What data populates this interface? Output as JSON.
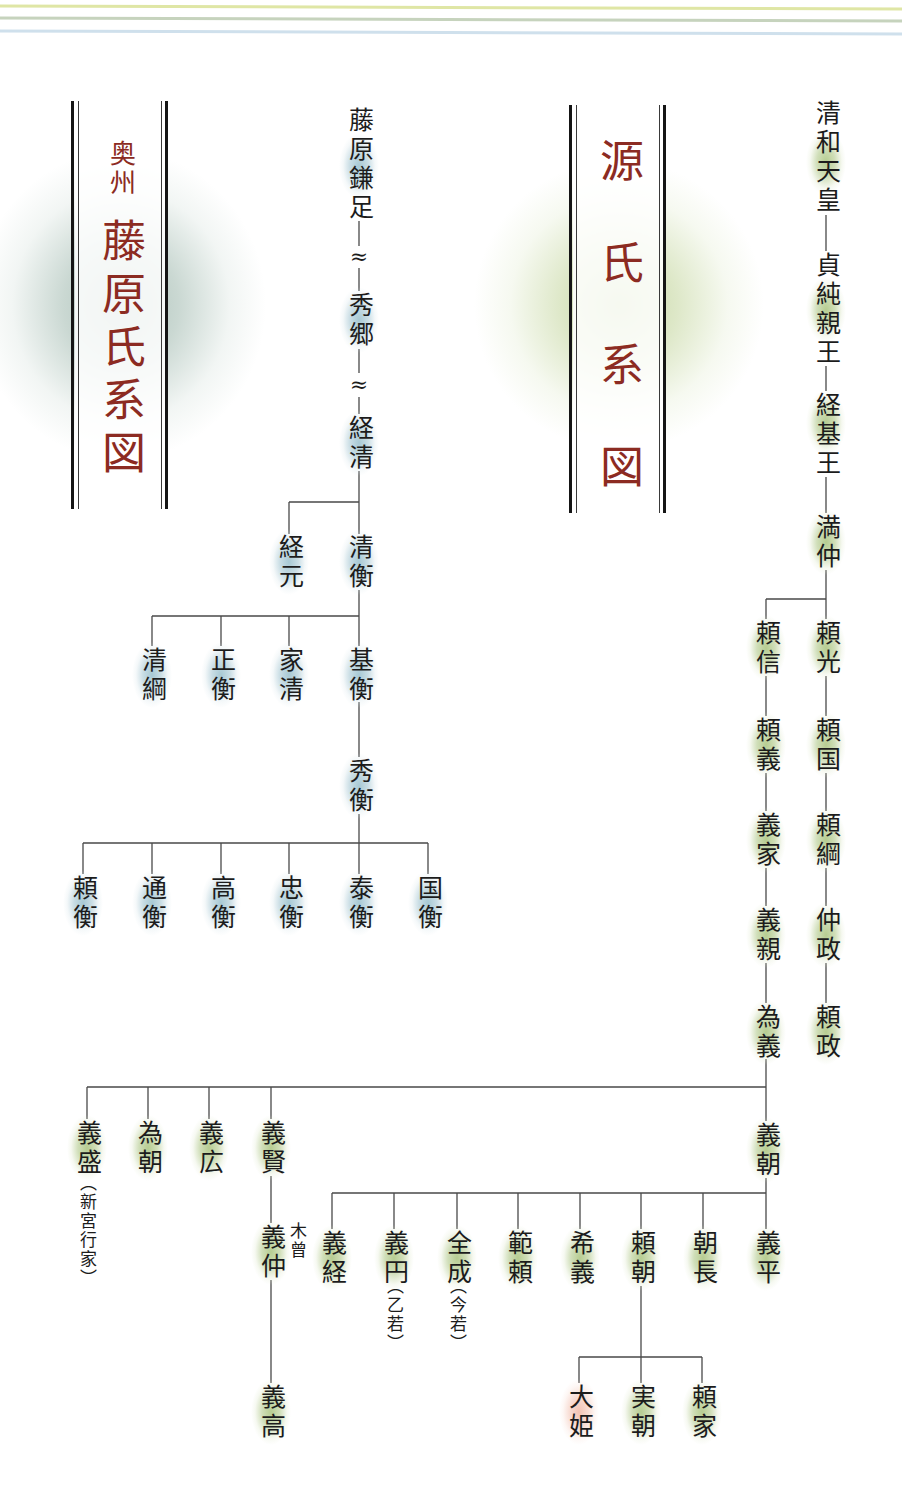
{
  "colors": {
    "title_red": "#8c2b22",
    "text": "#1c1c1c",
    "line": "#4a4a4a",
    "green_highlight": "#b0c888",
    "blue_highlight": "#a0c4d0",
    "pink_highlight": "#f0b8a6",
    "top_line_1": "#dfe6a5",
    "top_line_2": "#c6d3bd",
    "top_line_3": "#cfe0ec"
  },
  "fujiwara": {
    "title_prefix": "奥州",
    "title": "藤原氏系図",
    "gap_mark": "≈",
    "nodes": {
      "kamatari": "藤原鎌足",
      "hidesato": "秀郷",
      "tsunekiyo": "経清",
      "tsunemoto": "経元",
      "kiyohira": "清衡",
      "kiyotsuna": "清綱",
      "masahira": "正衡",
      "iekiyo": "家清",
      "motohira": "基衡",
      "hidehira": "秀衡",
      "yorihira": "頼衡",
      "michihira": "通衡",
      "takahira": "高衡",
      "tadahira": "忠衡",
      "yasuhira": "泰衡",
      "kunihira": "国衡"
    },
    "edges": [
      [
        "kamatari",
        "hidesato"
      ],
      [
        "hidesato",
        "tsunekiyo"
      ],
      [
        "tsunekiyo",
        "tsunemoto"
      ],
      [
        "tsunekiyo",
        "kiyohira"
      ],
      [
        "kiyohira",
        "kiyotsuna"
      ],
      [
        "kiyohira",
        "masahira"
      ],
      [
        "kiyohira",
        "iekiyo"
      ],
      [
        "kiyohira",
        "motohira"
      ],
      [
        "motohira",
        "hidehira"
      ],
      [
        "hidehira",
        "yorihira"
      ],
      [
        "hidehira",
        "michihira"
      ],
      [
        "hidehira",
        "takahira"
      ],
      [
        "hidehira",
        "tadahira"
      ],
      [
        "hidehira",
        "yasuhira"
      ],
      [
        "hidehira",
        "kunihira"
      ]
    ]
  },
  "genji": {
    "title": "源氏系図",
    "nodes": {
      "seiwa_tenno": "清和天皇",
      "sadazumi_shinno": "貞純親王",
      "tsunemoto_o": "経基王",
      "mitsunaka": "満仲",
      "yorimitsu": "頼光",
      "yorinobu": "頼信",
      "yoriyoshi": "頼義",
      "yorikuni": "頼国",
      "yoshiie": "義家",
      "yoritsuna": "頼綱",
      "yoshichika": "義親",
      "nakamasa": "仲政",
      "tameyoshi": "為義",
      "yorimasa": "頼政",
      "yoshimori": "義盛",
      "tametomo": "為朝",
      "yoshihiro": "義広",
      "yoshikata": "義賢",
      "yoshitomo": "義朝",
      "yoshinaka": "義仲",
      "yoshitaka": "義高",
      "yoshitsune": "義経",
      "gien": "義円",
      "zenjo": "全成",
      "noriyori": "範頼",
      "mareyoshi": "希義",
      "yoritomo": "頼朝",
      "tomonaga": "朝長",
      "yoshihira": "義平",
      "ohime": "大姫",
      "sanetomo": "実朝",
      "yoriie": "頼家"
    },
    "notes": {
      "yoshimori": "︵新宮行家︶",
      "yoshinaka": "木曾",
      "gien": "︵乙若︶",
      "zenjo": "︵今若︶"
    },
    "edges": [
      [
        "seiwa_tenno",
        "sadazumi_shinno"
      ],
      [
        "sadazumi_shinno",
        "tsunemoto_o"
      ],
      [
        "tsunemoto_o",
        "mitsunaka"
      ],
      [
        "mitsunaka",
        "yorimitsu"
      ],
      [
        "mitsunaka",
        "yorinobu"
      ],
      [
        "yorimitsu",
        "yorikuni"
      ],
      [
        "yorikuni",
        "yoritsuna"
      ],
      [
        "yoritsuna",
        "nakamasa"
      ],
      [
        "nakamasa",
        "yorimasa"
      ],
      [
        "yorinobu",
        "yoriyoshi"
      ],
      [
        "yoriyoshi",
        "yoshiie"
      ],
      [
        "yoshiie",
        "yoshichika"
      ],
      [
        "yoshichika",
        "tameyoshi"
      ],
      [
        "tameyoshi",
        "yoshitomo"
      ],
      [
        "tameyoshi",
        "yoshikata"
      ],
      [
        "tameyoshi",
        "yoshihiro"
      ],
      [
        "tameyoshi",
        "tametomo"
      ],
      [
        "tameyoshi",
        "yoshimori"
      ],
      [
        "yoshikata",
        "yoshinaka"
      ],
      [
        "yoshinaka",
        "yoshitaka"
      ],
      [
        "yoshitomo",
        "yoshihira"
      ],
      [
        "yoshitomo",
        "tomonaga"
      ],
      [
        "yoshitomo",
        "yoritomo"
      ],
      [
        "yoshitomo",
        "mareyoshi"
      ],
      [
        "yoshitomo",
        "noriyori"
      ],
      [
        "yoshitomo",
        "zenjo"
      ],
      [
        "yoshitomo",
        "gien"
      ],
      [
        "yoshitomo",
        "yoshitsune"
      ],
      [
        "yoritomo",
        "yoriie"
      ],
      [
        "yoritomo",
        "sanetomo"
      ],
      [
        "yoritomo",
        "ohime"
      ]
    ]
  }
}
